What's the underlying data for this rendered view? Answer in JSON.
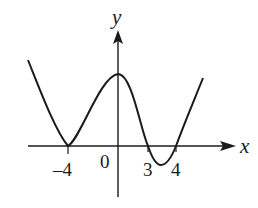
{
  "diagram": {
    "type": "function-graph",
    "axes": {
      "x_label": "x",
      "y_label": "y",
      "origin_label": "0"
    },
    "tick_labels": [
      "-4",
      "3",
      "4"
    ],
    "tick_labels_display": [
      "–4",
      "3",
      "4"
    ],
    "curve": {
      "description": "Continuous curve: decreasing from upper left, touching x-axis at x=-4, rising to a local maximum on the y-axis, decreasing through x=3 to a local minimum below the x-axis, rising through x=4 and continuing upward",
      "x_intercepts": [
        -4,
        3,
        4
      ],
      "tangent_at": -4,
      "local_max_x": 0,
      "local_min_between": [
        3,
        4
      ]
    },
    "colors": {
      "stroke": "#1a1a1a",
      "background": "#ffffff"
    }
  }
}
